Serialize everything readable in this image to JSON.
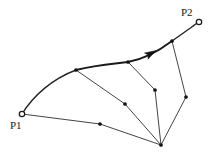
{
  "figure": {
    "background_color": "#ffffff",
    "stroke_color": "#1a1a1a",
    "width": 214,
    "height": 160,
    "labels": {
      "p1": "P1",
      "p2": "P2"
    },
    "endpoints": [
      {
        "id": "p1",
        "label": "P1",
        "x": 22,
        "y": 114,
        "marker": "open-circle",
        "label_x": 10,
        "label_y": 129
      },
      {
        "id": "p2",
        "label": "P2",
        "x": 199,
        "y": 22,
        "marker": "open-circle",
        "label_x": 181,
        "label_y": 16
      }
    ],
    "nodes": [
      {
        "id": "n-upper-left",
        "x": 76,
        "y": 70,
        "marker": "filled-dot"
      },
      {
        "id": "n-upper-mid",
        "x": 128,
        "y": 62,
        "marker": "filled-dot"
      },
      {
        "id": "n-upper-right",
        "x": 172,
        "y": 41,
        "marker": "filled-dot"
      },
      {
        "id": "n-interior-right",
        "x": 155,
        "y": 90,
        "marker": "filled-dot"
      },
      {
        "id": "n-interior-mid",
        "x": 125,
        "y": 104,
        "marker": "filled-dot"
      },
      {
        "id": "n-right-side",
        "x": 186,
        "y": 97,
        "marker": "filled-dot"
      },
      {
        "id": "n-lower-left",
        "x": 100,
        "y": 124,
        "marker": "filled-dot"
      },
      {
        "id": "n-apex",
        "x": 161,
        "y": 145,
        "marker": "filled-dot"
      }
    ],
    "paths": [
      {
        "id": "path-upper-curve",
        "kind": "curve",
        "weight": "thick",
        "d": "M 76 70 C 96 65 112 64 128 62 C 145 59 160 50 172 41"
      },
      {
        "id": "path-p2-tail",
        "kind": "curve",
        "weight": "med",
        "d": "M 172 41 C 182 34 192 27 197 23"
      },
      {
        "id": "path-left-arc",
        "kind": "curve",
        "weight": "med",
        "d": "M 22 114 C 33 96 52 79 76 70"
      },
      {
        "id": "path-bottom-left",
        "kind": "line",
        "weight": "thin",
        "d": "M 22 114 L 100 124"
      },
      {
        "id": "path-bottom-right",
        "kind": "line",
        "weight": "thin",
        "d": "M 100 124 L 161 145"
      },
      {
        "id": "path-spoke-upper-left",
        "kind": "line",
        "weight": "thin",
        "d": "M 76 70 L 125 104"
      },
      {
        "id": "path-spoke-interior-mid",
        "kind": "line",
        "weight": "thin",
        "d": "M 125 104 L 161 145"
      },
      {
        "id": "path-spoke-upper-mid",
        "kind": "line",
        "weight": "thin",
        "d": "M 128 62 L 155 90"
      },
      {
        "id": "path-spoke-interior-right",
        "kind": "line",
        "weight": "thin",
        "d": "M 155 90 L 161 145"
      },
      {
        "id": "path-spoke-upper-right",
        "kind": "line",
        "weight": "thin",
        "d": "M 172 41 L 186 97"
      },
      {
        "id": "path-spoke-right-side",
        "kind": "line",
        "weight": "thin",
        "d": "M 186 97 L 161 145"
      }
    ],
    "arrows": [
      {
        "id": "arrow-upper-curve",
        "x": 150,
        "y": 54,
        "angle_deg": -29,
        "size": 7
      }
    ]
  }
}
